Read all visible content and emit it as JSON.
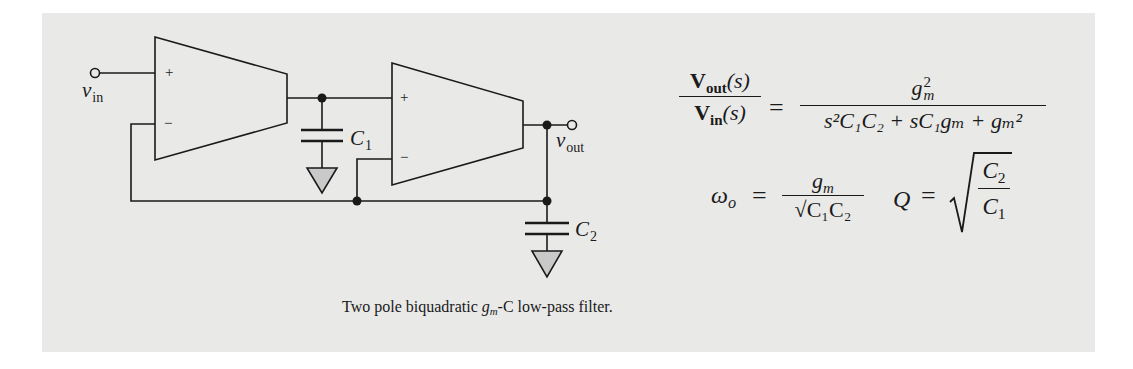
{
  "figure": {
    "caption_prefix": "Two pole biquadratic ",
    "caption_gm": "g",
    "caption_gm_sub": "m",
    "caption_suffix": "-C low-pass filter.",
    "background_color": "#e9e9e8",
    "line_color": "#1a1a1a"
  },
  "circuit": {
    "input_label": "v",
    "input_label_sub": "in",
    "output_label": "v",
    "output_label_sub": "out",
    "amp1": {
      "plus": "+",
      "minus": "−"
    },
    "amp2": {
      "plus": "+",
      "minus": "−"
    },
    "c1_label": "C",
    "c1_sub": "1",
    "c2_label": "C",
    "c2_sub": "2"
  },
  "equations": {
    "transfer": {
      "lhs_num_V": "V",
      "lhs_num_sub": "out",
      "lhs_num_arg": "(s)",
      "lhs_den_V": "V",
      "lhs_den_sub": "in",
      "lhs_den_arg": "(s)",
      "equals": "=",
      "rhs_num": "g",
      "rhs_num_sub": "m",
      "rhs_num_sup": "2",
      "rhs_den": "s²C₁C₂ + sC₁gₘ + gₘ²"
    },
    "omega": {
      "lhs": "ω",
      "lhs_sub": "o",
      "equals": "=",
      "num": "g",
      "num_sub": "m",
      "den": "C₁C₂"
    },
    "q": {
      "lhs": "Q",
      "equals": "=",
      "num": "C",
      "num_sub": "2",
      "den": "C",
      "den_sub": "1"
    }
  }
}
